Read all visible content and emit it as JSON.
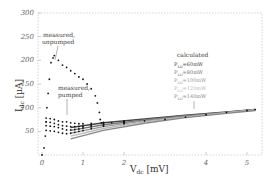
{
  "chart_data": {
    "type": "scatter",
    "title": "",
    "xlabel": "V_dc [mV]",
    "ylabel": "I_dc [µA]",
    "xlim": [
      0,
      5.3
    ],
    "ylim": [
      0,
      300
    ],
    "x_ticks": [
      "0",
      "1",
      "2",
      "4",
      "5"
    ],
    "y_ticks": [
      "50",
      "100",
      "150",
      "200",
      "250",
      "300"
    ],
    "grid": false,
    "annotations": [
      {
        "text": "measured, unpumped",
        "x": 0.5,
        "y": 250
      },
      {
        "text": "measured, pumped",
        "x": 1.0,
        "y": 145
      },
      {
        "text": "calculated",
        "x": 4.0,
        "y": 152
      }
    ],
    "legend": {
      "title": "calculated",
      "entries": [
        "P_LO=60mW",
        "P_LO=80mW",
        "P_LO=100mW",
        "P_LO=120mW",
        "P_LO=140mW"
      ],
      "colors": [
        "#444444",
        "#777777",
        "#999999",
        "#bbbbbb",
        "#888888"
      ]
    },
    "series": [
      {
        "name": "measured unpumped",
        "style": "dots",
        "x": [
          0.0,
          0.05,
          0.08,
          0.1,
          0.12,
          0.15,
          0.18,
          0.22,
          0.27,
          0.3,
          0.4,
          0.5,
          0.6,
          0.7,
          0.8,
          0.9,
          1.0,
          1.1,
          1.2,
          1.3,
          1.35,
          1.4,
          1.42,
          1.45,
          1.5,
          1.7,
          2.0,
          2.5,
          3.0,
          3.5,
          4.0,
          4.5,
          5.0,
          5.2
        ],
        "y": [
          0,
          15,
          40,
          70,
          100,
          130,
          160,
          195,
          205,
          210,
          200,
          190,
          185,
          178,
          172,
          165,
          160,
          150,
          140,
          125,
          110,
          90,
          75,
          68,
          68,
          68,
          70,
          72,
          75,
          80,
          85,
          90,
          94,
          96
        ]
      },
      {
        "name": "measured pumped 1",
        "style": "dots",
        "x": [
          0.1,
          0.2,
          0.3,
          0.4,
          0.5,
          0.6,
          0.7,
          0.8,
          0.9,
          1.0,
          1.2,
          1.5,
          2.0
        ],
        "y": [
          78,
          77,
          75,
          72,
          70,
          70,
          68,
          67,
          66,
          66,
          67,
          69,
          72
        ]
      },
      {
        "name": "measured pumped 2",
        "style": "dots",
        "x": [
          0.1,
          0.2,
          0.3,
          0.4,
          0.5,
          0.6,
          0.7,
          0.8,
          0.9,
          1.0,
          1.2,
          1.5,
          2.0
        ],
        "y": [
          70,
          69,
          67,
          64,
          62,
          61,
          60,
          60,
          60,
          61,
          63,
          66,
          70
        ]
      },
      {
        "name": "measured pumped 3",
        "style": "dots",
        "x": [
          0.1,
          0.2,
          0.3,
          0.4,
          0.5,
          0.6,
          0.7,
          0.8,
          0.9,
          1.0,
          1.2,
          1.5,
          2.0
        ],
        "y": [
          62,
          61,
          60,
          58,
          55,
          53,
          53,
          54,
          55,
          57,
          60,
          63,
          68
        ]
      },
      {
        "name": "measured pumped 4",
        "style": "dots",
        "x": [
          0.1,
          0.2,
          0.3,
          0.4,
          0.5,
          0.6,
          0.7,
          0.8,
          0.9,
          1.0,
          1.2,
          1.5,
          2.0
        ],
        "y": [
          52,
          51,
          50,
          48,
          46,
          45,
          46,
          48,
          50,
          52,
          56,
          61,
          66
        ]
      },
      {
        "name": "P_LO=60mW",
        "style": "line",
        "x": [
          0.7,
          1.5,
          2.5,
          3.5,
          4.5,
          5.2
        ],
        "y": [
          58,
          68,
          76,
          84,
          91,
          96
        ]
      },
      {
        "name": "P_LO=80mW",
        "style": "line",
        "x": [
          0.7,
          1.5,
          2.5,
          3.5,
          4.5,
          5.2
        ],
        "y": [
          52,
          64,
          74,
          83,
          90,
          96
        ]
      },
      {
        "name": "P_LO=100mW",
        "style": "line",
        "x": [
          0.7,
          1.5,
          2.5,
          3.5,
          4.5,
          5.2
        ],
        "y": [
          46,
          60,
          72,
          81,
          90,
          95
        ]
      },
      {
        "name": "P_LO=120mW",
        "style": "line",
        "x": [
          0.7,
          1.5,
          2.5,
          3.5,
          4.5,
          5.2
        ],
        "y": [
          40,
          56,
          70,
          80,
          89,
          95
        ]
      },
      {
        "name": "P_LO=140mW",
        "style": "line",
        "x": [
          0.7,
          1.5,
          2.5,
          3.5,
          4.5,
          5.2
        ],
        "y": [
          34,
          52,
          67,
          79,
          88,
          94
        ]
      }
    ]
  },
  "axis": {
    "xlabel_main": "V",
    "xlabel_sub": "dc",
    "xlabel_unit": " [mV]",
    "ylabel_main": "I",
    "ylabel_sub": "dc",
    "ylabel_unit": " [µA]"
  },
  "annotations": {
    "unpumped_1": "measured,",
    "unpumped_2": "unpumped",
    "pumped_1": "measured,",
    "pumped_2": "pumped",
    "calc_title": "calculated"
  },
  "legend": [
    {
      "p": "P",
      "sub": "LO",
      "val": "=60mW",
      "color": "#444444"
    },
    {
      "p": "P",
      "sub": "LO",
      "val": "=80mW",
      "color": "#777777"
    },
    {
      "p": "P",
      "sub": "LO",
      "val": "=100mW",
      "color": "#999999"
    },
    {
      "p": "P",
      "sub": "LO",
      "val": "=120mW",
      "color": "#bbbbbb"
    },
    {
      "p": "P",
      "sub": "LO",
      "val": "=140mW",
      "color": "#888888"
    }
  ]
}
